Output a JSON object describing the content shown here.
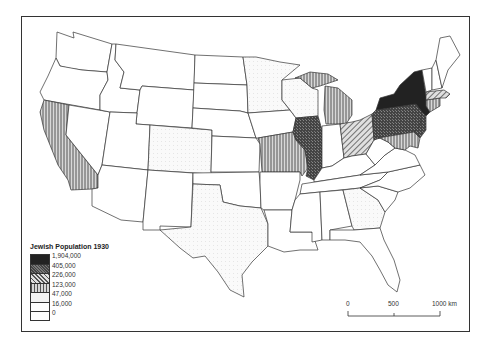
{
  "map": {
    "title": "Jewish Population 1930",
    "legend": [
      {
        "label": "1,904,000",
        "fill": "#222222",
        "pattern": "solid-dark"
      },
      {
        "label": "405,000",
        "fill": "#555555",
        "pattern": "crosshatch-dark"
      },
      {
        "label": "226,000",
        "fill": "#999999",
        "pattern": "diagonal"
      },
      {
        "label": "123,000",
        "fill": "#aaaaaa",
        "pattern": "vertical"
      },
      {
        "label": "47,000",
        "fill": "#f3f3f3",
        "pattern": "light"
      },
      {
        "label": "16,000",
        "fill": "#ffffff",
        "pattern": "white"
      },
      {
        "label": "0",
        "fill": "#ffffff",
        "pattern": "white"
      }
    ],
    "scale_bar": {
      "labels": [
        "0",
        "500",
        "1000 km"
      ]
    },
    "shaded_states": {
      "New York": "1,904,000",
      "Illinois": "405,000",
      "Pennsylvania": "405,000",
      "New Jersey": "405,000",
      "Massachusetts": "226,000",
      "Ohio": "226,000",
      "California": "123,000",
      "Michigan": "123,000",
      "Missouri": "123,000",
      "Maryland": "123,000",
      "Connecticut": "123,000",
      "Texas": "47,000"
    }
  }
}
